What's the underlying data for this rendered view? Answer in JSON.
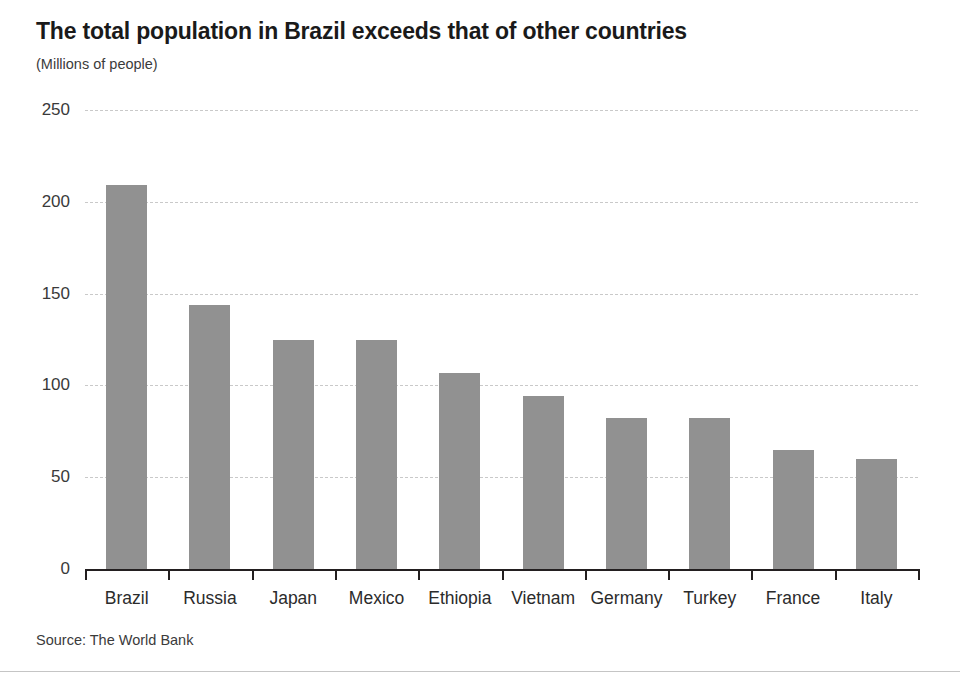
{
  "chart_data": {
    "type": "bar",
    "title": "The total population in Brazil exceeds that of other countries",
    "subtitle": "(Millions of people)",
    "xlabel": "",
    "ylabel": "",
    "unit_note": "(Millions of people)",
    "source": "Source: The World Bank",
    "categories": [
      "Brazil",
      "Russia",
      "Japan",
      "Mexico",
      "Ethiopia",
      "Vietnam",
      "Germany",
      "Turkey",
      "France",
      "Italy"
    ],
    "values": [
      209,
      144,
      125,
      125,
      107,
      94,
      82,
      82,
      65,
      60
    ],
    "ylim": [
      0,
      250
    ],
    "yticks": [
      0,
      50,
      100,
      150,
      200,
      250
    ],
    "ytick_labels": [
      "0",
      "50",
      "100",
      "150",
      "200",
      "250"
    ],
    "grid": true,
    "grid_axis": "y",
    "legend": false,
    "bar_color": "#919191",
    "background_color": "#ffffff",
    "text_color": "#231f20",
    "gridline_color": "#c9c9c9"
  }
}
